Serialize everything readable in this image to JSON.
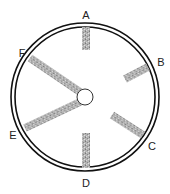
{
  "diagram": {
    "type": "wheel-with-spokes",
    "center": {
      "x": 85,
      "y": 97
    },
    "outer_ring": {
      "outer_radius": 74,
      "inner_radius": 70,
      "stroke": "#111111"
    },
    "hub": {
      "radius": 8,
      "fill": "#ffffff",
      "stroke": "#333333"
    },
    "spoke_fill": "#a8a8a8",
    "spoke_width": 8,
    "spokes": [
      {
        "id": "A",
        "x1": 86,
        "y1": 27,
        "x2": 86,
        "y2": 50
      },
      {
        "id": "B",
        "x1": 125,
        "y1": 79,
        "x2": 148,
        "y2": 67
      },
      {
        "id": "C",
        "x1": 112,
        "y1": 115,
        "x2": 143,
        "y2": 135
      },
      {
        "id": "D",
        "x1": 86,
        "y1": 133,
        "x2": 86,
        "y2": 168
      },
      {
        "id": "E",
        "x1": 80,
        "y1": 102,
        "x2": 25,
        "y2": 128
      },
      {
        "id": "F",
        "x1": 80,
        "y1": 92,
        "x2": 30,
        "y2": 58
      }
    ],
    "labels": [
      {
        "text": "A",
        "x": 86,
        "y": 19
      },
      {
        "text": "B",
        "x": 161,
        "y": 66
      },
      {
        "text": "C",
        "x": 152,
        "y": 150
      },
      {
        "text": "D",
        "x": 86,
        "y": 187
      },
      {
        "text": "E",
        "x": 13,
        "y": 139
      },
      {
        "text": "F",
        "x": 22,
        "y": 57
      }
    ]
  }
}
